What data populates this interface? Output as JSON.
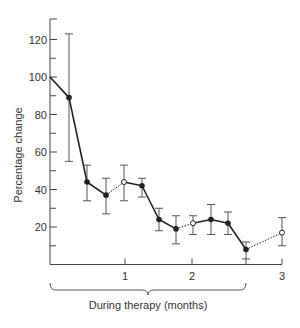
{
  "chart_data": {
    "type": "line",
    "title": "",
    "xlabel": "During therapy (months)",
    "ylabel": "Percentage change",
    "ylim": [
      0,
      130
    ],
    "y_ticks_major": [
      20,
      40,
      60,
      80,
      100,
      120
    ],
    "y_ticks_minor": [
      10,
      30,
      50,
      70,
      90,
      110
    ],
    "x_tick_labels": [
      "1",
      "2",
      "3"
    ],
    "grid": false,
    "legend": null,
    "brace_label": "During therapy (months)",
    "series": [
      {
        "name": "Percentage change",
        "points": [
          {
            "px": 50,
            "y": 100,
            "low": null,
            "high": null,
            "marker": "none"
          },
          {
            "px": 69,
            "y": 89,
            "low": 55,
            "high": 123,
            "marker": "filled"
          },
          {
            "px": 87,
            "y": 44,
            "low": 34,
            "high": 53,
            "marker": "filled"
          },
          {
            "px": 106,
            "y": 37,
            "low": 27,
            "high": 46,
            "marker": "filled"
          },
          {
            "px": 124,
            "y": 44,
            "low": 34,
            "high": 53,
            "marker": "open"
          },
          {
            "px": 142,
            "y": 42,
            "low": 36,
            "high": 46,
            "marker": "filled"
          },
          {
            "px": 159,
            "y": 24,
            "low": 18,
            "high": 30,
            "marker": "filled"
          },
          {
            "px": 176,
            "y": 19,
            "low": 11,
            "high": 26,
            "marker": "filled"
          },
          {
            "px": 193,
            "y": 22,
            "low": 16,
            "high": 26,
            "marker": "open"
          },
          {
            "px": 211,
            "y": 24,
            "low": 16,
            "high": 32,
            "marker": "filled"
          },
          {
            "px": 228,
            "y": 22,
            "low": 16,
            "high": 28,
            "marker": "filled"
          },
          {
            "px": 246,
            "y": 8,
            "low": 3,
            "high": 12,
            "marker": "filled"
          },
          {
            "px": 282,
            "y": 17,
            "low": 10,
            "high": 25,
            "marker": "open"
          }
        ],
        "segment_styles": [
          "solid",
          "solid",
          "solid",
          "dotted",
          "solid",
          "solid",
          "solid",
          "dotted",
          "solid",
          "solid",
          "solid",
          "dotted"
        ]
      }
    ]
  },
  "axes": {
    "x_ticks": [
      {
        "label": "1",
        "px": 125
      },
      {
        "label": "2",
        "px": 192
      },
      {
        "label": "",
        "px": 246
      },
      {
        "label": "3",
        "px": 282
      }
    ]
  }
}
